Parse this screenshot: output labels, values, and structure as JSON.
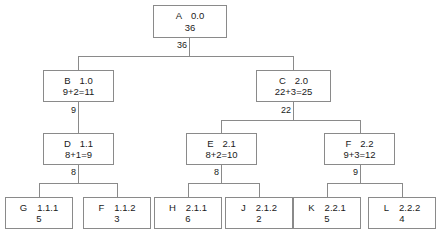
{
  "diagram": {
    "line_color": "#8a8a8a",
    "text_color": "#1a1a1a",
    "background": "#ffffff"
  },
  "nodes": {
    "a": {
      "id": "A",
      "code": "0.0",
      "value": "36"
    },
    "b": {
      "id": "B",
      "code": "1.0",
      "value": "9+2=11"
    },
    "c": {
      "id": "C",
      "code": "2.0",
      "value": "22+3=25"
    },
    "d": {
      "id": "D",
      "code": "1.1",
      "value": "8+1=9"
    },
    "e": {
      "id": "E",
      "code": "2.1",
      "value": "8+2=10"
    },
    "f": {
      "id": "F",
      "code": "2.2",
      "value": "9+3=12"
    },
    "g": {
      "id": "G",
      "code": "1.1.1",
      "value": "5"
    },
    "f2": {
      "id": "F",
      "code": "1.1.2",
      "value": "3"
    },
    "h": {
      "id": "H",
      "code": "2.1.1",
      "value": "6"
    },
    "j": {
      "id": "J",
      "code": "2.1.2",
      "value": "2"
    },
    "k": {
      "id": "K",
      "code": "2.2.1",
      "value": "5"
    },
    "l": {
      "id": "L",
      "code": "2.2.2",
      "value": "4"
    }
  },
  "edge_labels": {
    "a_children": "36",
    "b_children": "9",
    "c_children": "22",
    "d_children": "8",
    "e_children": "8",
    "f_children": "9"
  }
}
